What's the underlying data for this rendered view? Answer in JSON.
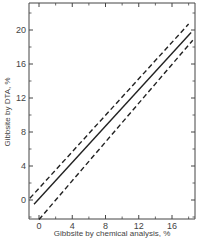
{
  "chart_data": {
    "type": "line",
    "title": "",
    "xlabel": "Gibbsite by chemical analysis, %",
    "ylabel": "Gibbsite by DTA, %",
    "xlim": [
      -1.2,
      18.6
    ],
    "ylim": [
      -2.8,
      23
    ],
    "x_ticks": [
      0,
      4,
      8,
      12,
      16
    ],
    "y_ticks": [
      0,
      4,
      8,
      12,
      16,
      20
    ],
    "grid": false,
    "legend": null,
    "series": [
      {
        "name": "upper confidence limit",
        "style": "dashed",
        "x": [
          -1.1,
          18.0
        ],
        "y": [
          0.2,
          20.7
        ]
      },
      {
        "name": "regression line",
        "style": "solid",
        "x": [
          -0.6,
          18.3
        ],
        "y": [
          -0.5,
          19.7
        ]
      },
      {
        "name": "lower confidence limit",
        "style": "dashed",
        "x": [
          0.0,
          18.5
        ],
        "y": [
          -2.3,
          18.8
        ]
      }
    ]
  },
  "labels": {
    "x_ticks": [
      "0",
      "4",
      "8",
      "12",
      "16"
    ],
    "y_ticks": [
      "0",
      "4",
      "8",
      "12",
      "16",
      "20"
    ],
    "xlabel": "Gibbsite by chemical analysis, %",
    "ylabel": "Gibbsite by DTA, %"
  },
  "colors": {
    "axis": "#444444",
    "line": "#222222",
    "background": "#ffffff"
  }
}
